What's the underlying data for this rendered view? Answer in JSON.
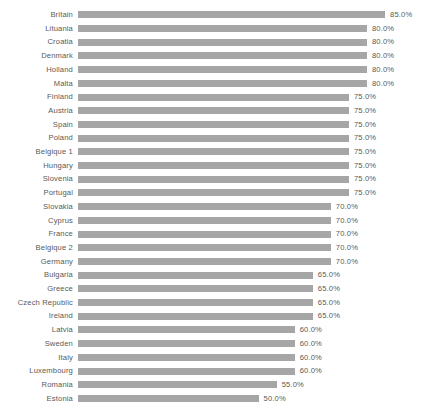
{
  "chart": {
    "background_color": "#ffffff",
    "bar_color": "#a6a6a6",
    "text_color": "#595959"
  },
  "chart_data": {
    "type": "bar",
    "orientation": "horizontal",
    "title": "",
    "subtitle": "",
    "xlabel": "",
    "ylabel": "",
    "xlim": [
      0,
      85
    ],
    "grid": false,
    "legend": false,
    "value_suffix": "%",
    "categories": [
      "Britain",
      "Lituania",
      "Croatia",
      "Denmark",
      "Holland",
      "Malta",
      "Finland",
      "Austria",
      "Spain",
      "Poland",
      "Belgique 1",
      "Hungary",
      "Slovenia",
      "Portugal",
      "Slovakia",
      "Cyprus",
      "France",
      "Belgique 2",
      "Germany",
      "Bulgaria",
      "Greece",
      "Czech Republic",
      "Ireland",
      "Latvia",
      "Sweden",
      "Italy",
      "Luxembourg",
      "Romania",
      "Estonia"
    ],
    "values": [
      85.0,
      80.0,
      80.0,
      80.0,
      80.0,
      80.0,
      75.0,
      75.0,
      75.0,
      75.0,
      75.0,
      75.0,
      75.0,
      75.0,
      70.0,
      70.0,
      70.0,
      70.0,
      70.0,
      65.0,
      65.0,
      65.0,
      65.0,
      60.0,
      60.0,
      60.0,
      60.0,
      55.0,
      50.0
    ],
    "value_labels": [
      "85.0%",
      "80.0%",
      "80.0%",
      "80.0%",
      "80.0%",
      "80.0%",
      "75.0%",
      "75.0%",
      "75.0%",
      "75.0%",
      "75.0%",
      "75.0%",
      "75.0%",
      "75.0%",
      "70.0%",
      "70.0%",
      "70.0%",
      "70.0%",
      "70.0%",
      "65.0%",
      "65.0%",
      "65.0%",
      "65.0%",
      "60.0%",
      "60.0%",
      "60.0%",
      "60.0%",
      "55.0%",
      "50.0%"
    ]
  }
}
